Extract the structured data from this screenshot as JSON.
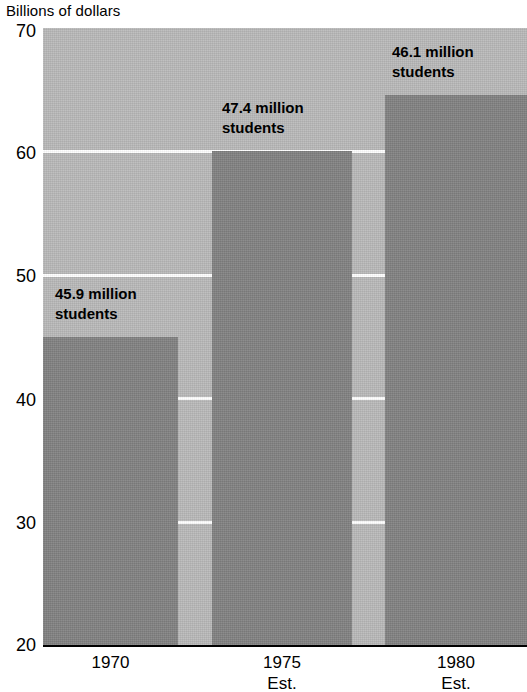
{
  "chart_data": {
    "type": "bar",
    "title": "",
    "subtitle": "",
    "ylabel": "Billions of dollars",
    "xlabel": "",
    "categories": [
      "1970",
      "1975",
      "1980"
    ],
    "category_sublabels": [
      "",
      "Est.",
      "Est."
    ],
    "values": [
      45.0,
      60.0,
      64.6
    ],
    "ylim": [
      20,
      70
    ],
    "yticks": [
      20,
      30,
      40,
      50,
      60,
      70
    ],
    "ytick_labels": [
      "20",
      "30",
      "40",
      "50",
      "60",
      "70"
    ],
    "grid": true,
    "grid_color": "#ffffff",
    "legend": null,
    "bar_color": "#808080",
    "plot_background": "#b8b8b8",
    "annotations": [
      "45.9 million students",
      "47.4 million students",
      "46.1 million students"
    ],
    "annotation_lines": [
      [
        "45.9 million",
        "students"
      ],
      [
        "47.4 million",
        "students"
      ],
      [
        "46.1 million",
        "students"
      ]
    ]
  },
  "axis": {
    "y_title": "Billions of dollars",
    "y_ticks": [
      {
        "label": "70"
      },
      {
        "label": "60"
      },
      {
        "label": "50"
      },
      {
        "label": "40"
      },
      {
        "label": "30"
      },
      {
        "label": "20"
      }
    ],
    "x_ticks": [
      {
        "label": "1970",
        "sub": ""
      },
      {
        "label": "1975",
        "sub": "Est."
      },
      {
        "label": "1980",
        "sub": "Est."
      }
    ]
  },
  "bars": [
    {
      "name": "1970",
      "line1": "45.9 million",
      "line2": "students"
    },
    {
      "name": "1975",
      "line1": "47.4 million",
      "line2": "students"
    },
    {
      "name": "1980",
      "line1": "46.1 million",
      "line2": "students"
    }
  ]
}
